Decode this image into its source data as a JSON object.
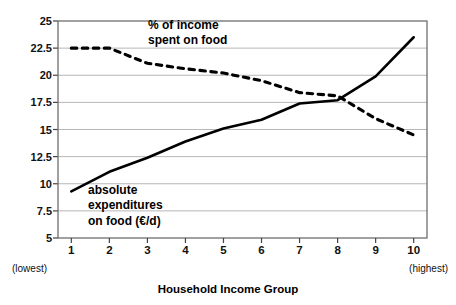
{
  "chart_data": {
    "type": "line",
    "title": "",
    "xlabel": "Household Income Group",
    "ylabel": "",
    "categories": [
      "1",
      "2",
      "3",
      "4",
      "5",
      "6",
      "7",
      "8",
      "9",
      "10"
    ],
    "x": [
      1,
      2,
      3,
      4,
      5,
      6,
      7,
      8,
      9,
      10
    ],
    "ylim": [
      5,
      25
    ],
    "xlim": [
      0.65,
      10.35
    ],
    "yticks": [
      5,
      7.5,
      10,
      12.5,
      15,
      17.5,
      20,
      22.5,
      25
    ],
    "ytick_labels": [
      "5",
      "7.5",
      "10",
      "12.5",
      "15",
      "17.5",
      "20",
      "22.5",
      "25"
    ],
    "grid": true,
    "grid_axis": "y",
    "legend": "none",
    "series": [
      {
        "name": "absolute expenditures on food (€/d)",
        "style": "solid",
        "color": "#000000",
        "values": [
          9.3,
          11.1,
          12.4,
          13.9,
          15.1,
          15.9,
          17.4,
          17.7,
          19.9,
          23.5
        ]
      },
      {
        "name": "% of income spent on food",
        "style": "dashed",
        "color": "#000000",
        "values": [
          22.5,
          22.5,
          21.1,
          20.6,
          20.2,
          19.5,
          18.4,
          18.1,
          16.0,
          14.5
        ]
      }
    ],
    "annotations": [
      {
        "id": "pct-label",
        "line1": "% of income",
        "line2": "spent on food"
      },
      {
        "id": "abs-label",
        "line1": "absolute",
        "line2": "expenditures",
        "line3": "on food (€/d)"
      }
    ],
    "axis_end_notes": {
      "left": "(lowest)",
      "right": "(highest)"
    }
  },
  "axis": {
    "title": "Household Income Group"
  }
}
